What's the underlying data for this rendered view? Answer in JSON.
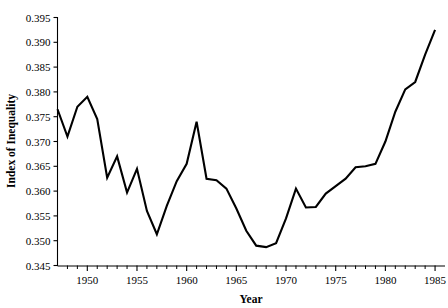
{
  "chart_data": {
    "type": "line",
    "title": "",
    "xlabel": "Year",
    "ylabel": "Index of Inequality",
    "xlim": [
      1947,
      1986
    ],
    "ylim": [
      0.345,
      0.395
    ],
    "grid": false,
    "legend": "none",
    "x_major_ticks": [
      1950,
      1955,
      1960,
      1965,
      1970,
      1975,
      1980,
      1985
    ],
    "x_major_tick_labels": [
      "1950",
      "1955",
      "1960",
      "1965",
      "1970",
      "1975",
      "1980",
      "1985"
    ],
    "x_minor_tick_step": 1,
    "y_ticks": [
      0.345,
      0.35,
      0.355,
      0.36,
      0.365,
      0.37,
      0.375,
      0.38,
      0.385,
      0.39,
      0.395
    ],
    "y_tick_labels": [
      "0.345",
      "0.350",
      "0.355",
      "0.360",
      "0.365",
      "0.370",
      "0.375",
      "0.380",
      "0.385",
      "0.390",
      "0.395"
    ],
    "series": [
      {
        "name": "Index of Inequality",
        "x": [
          1947,
          1948,
          1949,
          1950,
          1951,
          1952,
          1953,
          1954,
          1955,
          1956,
          1957,
          1958,
          1959,
          1960,
          1961,
          1962,
          1963,
          1964,
          1965,
          1966,
          1967,
          1968,
          1969,
          1970,
          1971,
          1972,
          1973,
          1974,
          1975,
          1976,
          1977,
          1978,
          1979,
          1980,
          1981,
          1982,
          1983,
          1984,
          1985
        ],
        "values": [
          0.3765,
          0.371,
          0.377,
          0.379,
          0.3745,
          0.3627,
          0.367,
          0.3597,
          0.3645,
          0.356,
          0.3513,
          0.357,
          0.362,
          0.3655,
          0.374,
          0.3625,
          0.3622,
          0.3605,
          0.3565,
          0.352,
          0.349,
          0.3487,
          0.3495,
          0.3545,
          0.3605,
          0.3567,
          0.3568,
          0.3595,
          0.361,
          0.3625,
          0.3648,
          0.365,
          0.3655,
          0.37,
          0.376,
          0.3805,
          0.382,
          0.3875,
          0.3925
        ]
      }
    ]
  },
  "axes": {
    "ylabel": "Index of Inequality",
    "xlabel": "Year"
  }
}
